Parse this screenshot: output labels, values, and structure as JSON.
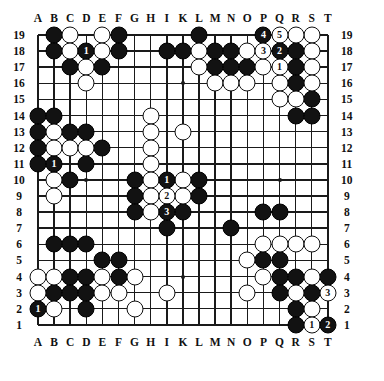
{
  "diagram": {
    "type": "go-board",
    "size": 19,
    "col_labels": [
      "A",
      "B",
      "C",
      "D",
      "E",
      "F",
      "G",
      "H",
      "I",
      "K",
      "L",
      "M",
      "N",
      "O",
      "P",
      "Q",
      "R",
      "S",
      "T"
    ],
    "row_labels": [
      "19",
      "18",
      "17",
      "16",
      "15",
      "14",
      "13",
      "12",
      "11",
      "10",
      "9",
      "8",
      "7",
      "6",
      "5",
      "4",
      "3",
      "2",
      "1"
    ],
    "colors": {
      "black": "#121212",
      "white": "#ffffff",
      "line": "#1a1a1a",
      "background": "#ffffff"
    },
    "hoshi_points": [
      "D16",
      "K16",
      "Q16",
      "D10",
      "K10",
      "Q10",
      "D4",
      "K4",
      "Q4"
    ]
  },
  "stones": {
    "black": [
      "B19",
      "F19",
      "L19",
      "P19",
      "B18",
      "F18",
      "I18",
      "K18",
      "M18",
      "N18",
      "Q18",
      "R18",
      "C17",
      "E17",
      "M17",
      "N17",
      "O17",
      "R17",
      "R16",
      "S15",
      "A14",
      "B14",
      "R14",
      "S14",
      "A13",
      "C13",
      "D13",
      "A12",
      "E12",
      "A11",
      "D11",
      "C10",
      "G10",
      "I10",
      "L10",
      "G9",
      "L9",
      "G8",
      "K8",
      "I7",
      "N7",
      "P8",
      "Q8",
      "B6",
      "C6",
      "D6",
      "E5",
      "F5",
      "P5",
      "Q5",
      "C4",
      "D4",
      "F4",
      "Q4",
      "R4",
      "T4",
      "B3",
      "C3",
      "D3",
      "Q3",
      "S3",
      "A2",
      "D2",
      "R2",
      "R1",
      "T1"
    ],
    "white": [
      "C19",
      "E19",
      "S19",
      "C18",
      "E18",
      "L18",
      "O18",
      "R19",
      "S18",
      "D17",
      "L17",
      "M17x",
      "P17",
      "S17",
      "D16",
      "M16",
      "N16",
      "O16",
      "Q16",
      "S16",
      "Q15",
      "R15",
      "H14",
      "B13",
      "B12",
      "C12",
      "D12",
      "A11w",
      "B10",
      "B9",
      "H13",
      "K13",
      "H12",
      "H11",
      "H10",
      "K10",
      "H9",
      "K9",
      "H8",
      "P6",
      "R6",
      "S6",
      "Q6x",
      "O5",
      "P5w",
      "Q5w",
      "A4",
      "B4",
      "E4",
      "G4",
      "P4",
      "S4",
      "A3",
      "E3",
      "F3",
      "I3",
      "O3",
      "R3",
      "B2",
      "G2",
      "S2"
    ],
    "numbered": [
      {
        "label": "1",
        "color": "black",
        "point": "D18"
      },
      {
        "label": "4",
        "color": "black",
        "point": "P19"
      },
      {
        "label": "5",
        "color": "white",
        "point": "Q19"
      },
      {
        "label": "3",
        "color": "white",
        "point": "P18"
      },
      {
        "label": "2",
        "color": "black",
        "point": "Q18"
      },
      {
        "label": "1",
        "color": "white",
        "point": "Q17"
      },
      {
        "label": "1",
        "color": "black",
        "point": "B11"
      },
      {
        "label": "1",
        "color": "black",
        "point": "I10"
      },
      {
        "label": "2",
        "color": "white",
        "point": "I9"
      },
      {
        "label": "3",
        "color": "black",
        "point": "I8"
      },
      {
        "label": "1",
        "color": "black",
        "point": "A2"
      },
      {
        "label": "3",
        "color": "white",
        "point": "T3"
      },
      {
        "label": "1",
        "color": "white",
        "point": "S1"
      },
      {
        "label": "2",
        "color": "black",
        "point": "T1"
      }
    ]
  },
  "layout": {
    "origin_x": 38,
    "origin_y": 35,
    "step": 16.1,
    "stone_size": 17
  }
}
